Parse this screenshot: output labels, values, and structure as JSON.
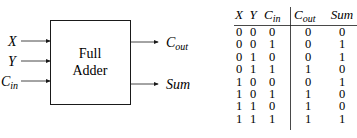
{
  "diagram": {
    "block_label_line1": "Full",
    "block_label_line2": "Adder",
    "inputs": [
      {
        "main": "X",
        "sub": ""
      },
      {
        "main": "Y",
        "sub": ""
      },
      {
        "main": "C",
        "sub": "in"
      }
    ],
    "outputs": [
      {
        "main": "C",
        "sub": "out"
      },
      {
        "main": "Sum",
        "sub": ""
      }
    ]
  },
  "truth_table": {
    "headers": [
      {
        "main": "X",
        "sub": ""
      },
      {
        "main": "Y",
        "sub": ""
      },
      {
        "main": "C",
        "sub": "in"
      },
      {
        "main": "C",
        "sub": "out"
      },
      {
        "main": "Sum",
        "sub": ""
      }
    ],
    "rows": [
      [
        "0",
        "0",
        "0",
        "0",
        "0"
      ],
      [
        "0",
        "0",
        "1",
        "0",
        "1"
      ],
      [
        "0",
        "1",
        "0",
        "0",
        "1"
      ],
      [
        "0",
        "1",
        "1",
        "1",
        "0"
      ],
      [
        "1",
        "0",
        "0",
        "0",
        "1"
      ],
      [
        "1",
        "0",
        "1",
        "1",
        "0"
      ],
      [
        "1",
        "1",
        "0",
        "1",
        "0"
      ],
      [
        "1",
        "1",
        "1",
        "1",
        "1"
      ]
    ]
  }
}
